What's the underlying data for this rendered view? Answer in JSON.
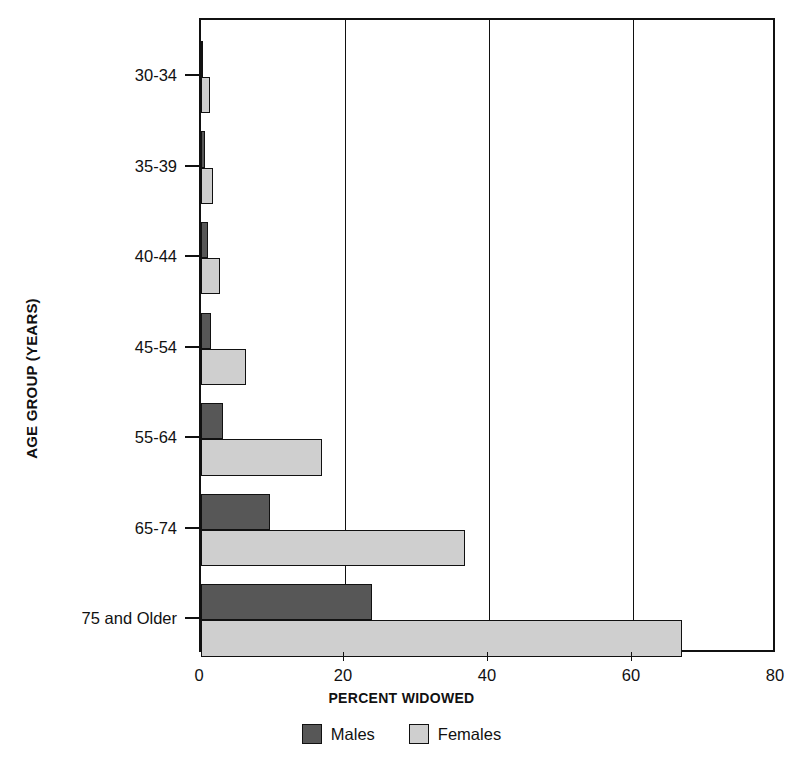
{
  "chart_data": {
    "type": "bar",
    "orientation": "horizontal",
    "title": "",
    "xlabel": "PERCENT WIDOWED",
    "ylabel": "AGE GROUP (YEARS)",
    "categories": [
      "30-34",
      "35-39",
      "40-44",
      "45-54",
      "55-64",
      "65-74",
      "75 and Older"
    ],
    "series": [
      {
        "name": "Males",
        "color": "#575757",
        "values": [
          0.3,
          0.6,
          1.0,
          1.4,
          3.0,
          9.6,
          23.8
        ]
      },
      {
        "name": "Females",
        "color": "#cfcfcf",
        "values": [
          1.3,
          1.7,
          2.7,
          6.2,
          16.8,
          36.6,
          66.8
        ]
      }
    ],
    "xlim": [
      0,
      80
    ],
    "xticks": [
      0,
      20,
      40,
      60,
      80
    ],
    "xtick_labels": [
      "0",
      "20",
      "40",
      "60",
      "80"
    ],
    "grid": "vertical",
    "legend_position": "bottom-center"
  },
  "axes": {
    "y_title": "AGE GROUP (YEARS)",
    "x_title": "PERCENT WIDOWED"
  },
  "legend": {
    "items": [
      {
        "label": "Males",
        "color": "#575757"
      },
      {
        "label": "Females",
        "color": "#cfcfcf"
      }
    ]
  }
}
